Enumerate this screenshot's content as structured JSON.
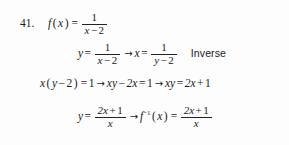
{
  "problem": {
    "number": "41.",
    "topic_label": "Inverse"
  },
  "symbols": {
    "equals": "=",
    "minus": "−",
    "plus": "+",
    "arrow": "→",
    "lparen": "(",
    "rparen": ")",
    "one": "1",
    "two": "2",
    "x": "x",
    "y": "y",
    "f": "f",
    "inverse_exponent": "−1"
  },
  "lines": {
    "line1": {
      "function_name": "f",
      "arg_open": "(",
      "arg": "x",
      "arg_close": ")",
      "equals": "=",
      "numerator": "1",
      "den_var": "x",
      "den_minus": "−",
      "den_const": "2"
    },
    "line2": {
      "lhs_var": "y",
      "equals1": "=",
      "frac1_num": "1",
      "frac1_den_var": "x",
      "frac1_den_minus": "−",
      "frac1_den_const": "2",
      "arrow": "→",
      "rhs_var": "x",
      "equals2": "=",
      "frac2_num": "1",
      "frac2_den_var": "y",
      "frac2_den_minus": "−",
      "frac2_den_const": "2",
      "annotation": "Inverse"
    },
    "line3": {
      "seg1_var": "x",
      "seg1_open": "(",
      "seg1_inner_var": "y",
      "seg1_minus": "−",
      "seg1_const": "2",
      "seg1_close": ")",
      "seg1_equals": "=",
      "seg1_result": "1",
      "arrow1": "→",
      "seg2_term1": "xy",
      "seg2_minus": "−",
      "seg2_term2": "2x",
      "seg2_equals": "=",
      "seg2_result": "1",
      "arrow2": "→",
      "seg3_lhs": "xy",
      "seg3_equals": "=",
      "seg3_term1": "2x",
      "seg3_plus": "+",
      "seg3_term2": "1"
    },
    "line4": {
      "lhs_var": "y",
      "equals1": "=",
      "frac1_num_coef": "2x",
      "frac1_num_plus": "+",
      "frac1_num_const": "1",
      "frac1_den": "x",
      "arrow": "→",
      "fn_name": "f",
      "fn_exponent": "−1",
      "fn_open": "(",
      "fn_arg": "x",
      "fn_close": ")",
      "equals2": "=",
      "frac2_num_coef": "2x",
      "frac2_num_plus": "+",
      "frac2_num_const": "1",
      "frac2_den": "x"
    }
  },
  "style": {
    "ink_color": "#1a1a1a",
    "paper_color": "#fdfdfd",
    "rule_color": "#222222"
  }
}
